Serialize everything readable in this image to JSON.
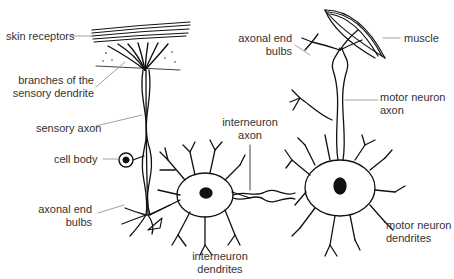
{
  "diagram": {
    "labels": {
      "skin_receptors": "skin receptors",
      "branches_line1": "branches of the",
      "branches_line2": "sensory dendrite",
      "sensory_axon": "sensory axon",
      "cell_body": "cell body",
      "axonal_end_left_1": "axonal end",
      "axonal_end_left_2": "bulbs",
      "interneuron_axon_1": "interneuron",
      "interneuron_axon_2": "axon",
      "interneuron_dendrites_1": "interneuron",
      "interneuron_dendrites_2": "dendrites",
      "axonal_end_right_1": "axonal end",
      "axonal_end_right_2": "bulbs",
      "muscle": "muscle",
      "motor_axon_1": "motor neuron",
      "motor_axon_2": "axon",
      "motor_dendrites_1": "motor neuron",
      "motor_dendrites_2": "dendrites"
    },
    "colors": {
      "ink": "#111111",
      "label": "#333333",
      "leader": "#888888"
    }
  }
}
